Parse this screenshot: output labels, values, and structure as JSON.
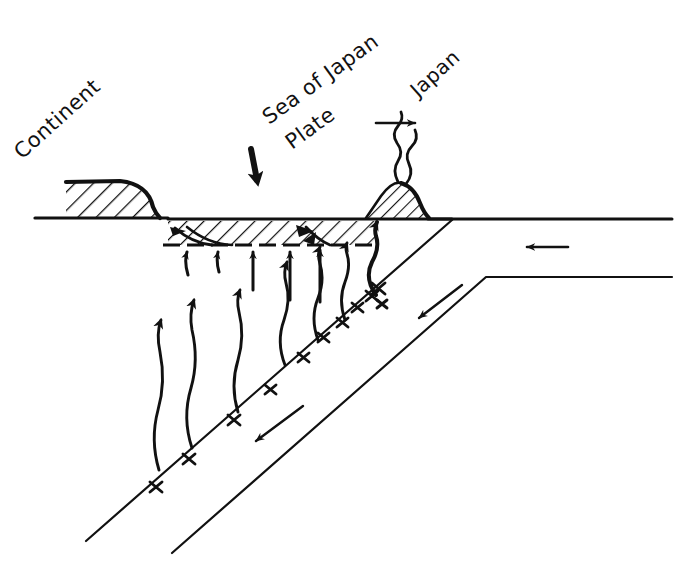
{
  "figure": {
    "background_color": "#ffffff",
    "ink_color": "#111111",
    "width": 682,
    "height": 569
  },
  "labels": {
    "continent": "Continent",
    "sea_of_japan_line1": "Sea of Japan",
    "sea_of_japan_line2": "Plate",
    "japan": "Japan"
  },
  "annotations": {
    "arrow_down_sea_of_japan": "down-arrow",
    "arrow_right_japan": "right-arrow",
    "arrow_left_pacific": "left-arrow",
    "arrow_downslope_slab": "down-left-arrow",
    "earthquake_foci_symbol": "x",
    "earthquake_foci_count": 11,
    "rising_magma_arrows_count": 6,
    "block_uplift_arrows_count": 5,
    "listric_faults_count": 3,
    "volcano_smoke_plumes": 2
  },
  "features": {
    "continent_wedge": "hatched-continental-crust-wedge",
    "rifted_crust_band": "hatched-thinned-crust-band",
    "volcano": "hatched-volcano-cone",
    "subducting_slab": "pacific-plate-slab",
    "surface_line": "earth-surface",
    "moho_line": "dashed-base-of-crust"
  }
}
